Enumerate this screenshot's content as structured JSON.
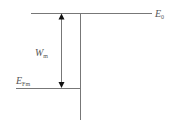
{
  "diagram": {
    "type": "energy-level-diagram",
    "labels": {
      "vacuum_level": {
        "main": "E",
        "sub": "0"
      },
      "work_function": {
        "main": "W",
        "sub": "m"
      },
      "fermi_level": {
        "main": "E",
        "sub": "Fm"
      }
    },
    "colors": {
      "line": "#777777",
      "arrow": "#111111",
      "text": "#555555"
    }
  }
}
